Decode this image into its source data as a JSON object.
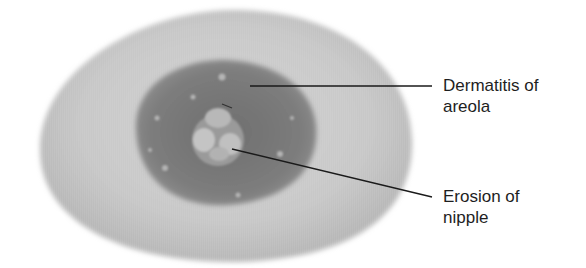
{
  "figure": {
    "type": "medical illustration",
    "colors": {
      "background": "#ffffff",
      "skin": "#c9c9c9",
      "skin_edge": "#b4b4b4",
      "areola": "#7d7d7d",
      "nipple": "#bdbdbd",
      "leader_line": "#1a1a1a",
      "text": "#1e1e1e"
    }
  },
  "labels": [
    {
      "id": "areola",
      "line1": "Dermatitis of",
      "line2": "areola"
    },
    {
      "id": "nipple",
      "line1": "Erosion of",
      "line2": "nipple"
    }
  ]
}
